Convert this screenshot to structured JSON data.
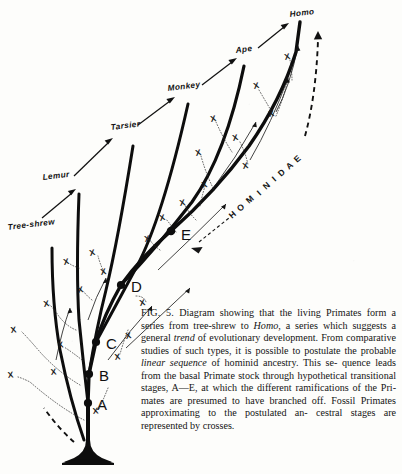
{
  "figure": {
    "type": "evolutionary-tree-diagram",
    "title_in_caption": "FIG. 5.",
    "background_color": "#fdfdfb",
    "ink_color": "#0d0d0d"
  },
  "branch_labels": [
    {
      "name": "tree-shrew",
      "text": "Tree-shrew",
      "x": 8,
      "y": 228
    },
    {
      "name": "lemur",
      "text": "Lemur",
      "x": 43,
      "y": 178
    },
    {
      "name": "tarsier",
      "text": "Tarsier",
      "x": 111,
      "y": 128
    },
    {
      "name": "monkey",
      "text": "Monkey",
      "x": 168,
      "y": 89
    },
    {
      "name": "ape",
      "text": "Ape",
      "x": 236,
      "y": 51
    },
    {
      "name": "homo",
      "text": "Homo",
      "x": 290,
      "y": 15
    }
  ],
  "clade_label": {
    "text": "HOMINIDAE",
    "letters": [
      "H",
      "O",
      "M",
      "I",
      "N",
      "I",
      "D",
      "A",
      "E"
    ]
  },
  "nodes": [
    {
      "letter": "A",
      "x": 88,
      "y": 403,
      "label_x": 97,
      "label_y": 410
    },
    {
      "letter": "B",
      "x": 89,
      "y": 374,
      "label_x": 99,
      "label_y": 381
    },
    {
      "letter": "C",
      "x": 96,
      "y": 342,
      "label_x": 106,
      "label_y": 349
    },
    {
      "letter": "D",
      "x": 121,
      "y": 285,
      "label_x": 131,
      "label_y": 292
    },
    {
      "letter": "E",
      "x": 171,
      "y": 231,
      "label_x": 181,
      "label_y": 239
    }
  ],
  "crosses": [
    {
      "x": 14,
      "y": 330
    },
    {
      "x": 11,
      "y": 375
    },
    {
      "x": 47,
      "y": 304
    },
    {
      "x": 61,
      "y": 345
    },
    {
      "x": 54,
      "y": 372
    },
    {
      "x": 67,
      "y": 262
    },
    {
      "x": 81,
      "y": 290
    },
    {
      "x": 96,
      "y": 411
    },
    {
      "x": 93,
      "y": 253
    },
    {
      "x": 104,
      "y": 272
    },
    {
      "x": 118,
      "y": 357
    },
    {
      "x": 129,
      "y": 336
    },
    {
      "x": 143,
      "y": 303
    },
    {
      "x": 148,
      "y": 239
    },
    {
      "x": 163,
      "y": 218
    },
    {
      "x": 183,
      "y": 203
    },
    {
      "x": 199,
      "y": 153
    },
    {
      "x": 205,
      "y": 185
    },
    {
      "x": 214,
      "y": 119
    },
    {
      "x": 236,
      "y": 138
    },
    {
      "x": 246,
      "y": 166
    },
    {
      "x": 257,
      "y": 86
    },
    {
      "x": 272,
      "y": 114
    },
    {
      "x": 288,
      "y": 57
    }
  ],
  "caption": {
    "fig_number": "FIG. 5.",
    "lines": [
      "Diagram showing that the living Primates",
      "form a series from tree-shrew to ",
      ", a series",
      "which suggests a general ",
      " of evolutionary",
      "development. From comparative studies of such",
      "types, it is possible to postulate the probable",
      "linear sequence",
      " of hominid ancestry. This se-",
      "quence leads from the basal Primate stock",
      "through hypothetical transitional stages, A—E,",
      "at which the different ramifications of the Pri-",
      "mates are presumed to have branched off. Fossil",
      "Primates approximating to the postulated an-",
      "cestral stages are represented by crosses."
    ],
    "italic_words": [
      "Homo",
      "trend",
      "linear sequence"
    ],
    "full_text": "FIG. 5. Diagram showing that the living Primates form a series from tree-shrew to Homo, a series which suggests a general trend of evolutionary development. From comparative studies of such types, it is possible to postulate the probable linear sequence of hominid ancestry. This sequence leads from the basal Primate stock through hypothetical transitional stages, A—E, at which the different ramifications of the Primates are presumed to have branched off. Fossil Primates approximating to the postulated ancestral stages are represented by crosses."
  }
}
